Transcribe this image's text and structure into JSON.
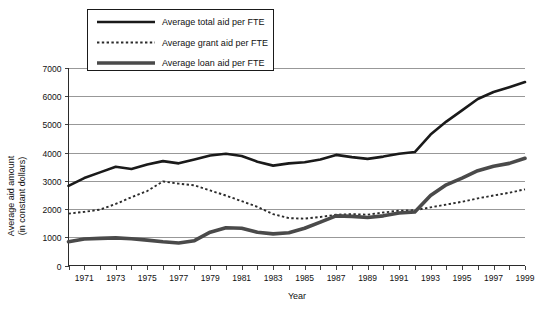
{
  "chart_data": {
    "type": "line",
    "title": "",
    "xlabel": "Year",
    "ylabel": "Average aid amount (in constant dollars)",
    "ylabel_line1": "Average aid amount",
    "ylabel_line2": "(in constant  dollars)",
    "xlim": [
      1970,
      1999
    ],
    "ylim": [
      0,
      7000
    ],
    "ytick_values": [
      0,
      1000,
      2000,
      3000,
      4000,
      5000,
      6000,
      7000
    ],
    "ytick_labels": [
      "0",
      "1000",
      "2000",
      "3000",
      "4000",
      "5000",
      "6000",
      "7000"
    ],
    "xtick_labels": [
      "1971",
      "1973",
      "1975",
      "1977",
      "1979",
      "1981",
      "1983",
      "1985",
      "1987",
      "1989",
      "1991",
      "1993",
      "1995",
      "1997",
      "1999"
    ],
    "xtick_values": [
      1971,
      1973,
      1975,
      1977,
      1979,
      1981,
      1983,
      1985,
      1987,
      1989,
      1991,
      1993,
      1995,
      1997,
      1999
    ],
    "x": [
      1970,
      1971,
      1972,
      1973,
      1974,
      1975,
      1976,
      1977,
      1978,
      1979,
      1980,
      1981,
      1982,
      1983,
      1984,
      1985,
      1986,
      1987,
      1988,
      1989,
      1990,
      1991,
      1992,
      1993,
      1994,
      1995,
      1996,
      1997,
      1998,
      1999
    ],
    "grid": "horizontal",
    "legend_position": "top-left",
    "series": [
      {
        "name": "Average total aid per FTE",
        "style": "solid",
        "color": "#1a1a1a",
        "width": 2.6,
        "values": [
          2820,
          3100,
          3300,
          3500,
          3420,
          3580,
          3700,
          3620,
          3760,
          3900,
          3960,
          3880,
          3680,
          3540,
          3620,
          3660,
          3760,
          3920,
          3840,
          3780,
          3860,
          3960,
          4020,
          4640,
          5100,
          5500,
          5900,
          6150,
          6320,
          6500
        ]
      },
      {
        "name": "Average grant aid per FTE",
        "style": "dotted",
        "color": "#2b2b2b",
        "width": 1.9,
        "values": [
          1840,
          1900,
          1980,
          2180,
          2420,
          2640,
          2980,
          2900,
          2840,
          2660,
          2480,
          2280,
          2080,
          1820,
          1680,
          1660,
          1720,
          1800,
          1820,
          1800,
          1880,
          1940,
          1960,
          2060,
          2160,
          2260,
          2380,
          2480,
          2580,
          2700
        ]
      },
      {
        "name": "Average loan aid per FTE",
        "style": "solid",
        "color": "#4a4a4a",
        "width": 3.6,
        "values": [
          840,
          940,
          960,
          980,
          950,
          900,
          840,
          800,
          880,
          1180,
          1340,
          1320,
          1180,
          1120,
          1160,
          1320,
          1540,
          1760,
          1740,
          1700,
          1760,
          1860,
          1900,
          2480,
          2860,
          3100,
          3360,
          3520,
          3620,
          3800
        ]
      }
    ]
  },
  "legend": {
    "items": [
      {
        "label": "Average total aid per FTE",
        "style": "solid-thin",
        "color": "#1a1a1a"
      },
      {
        "label": "Average grant aid per FTE",
        "style": "dotted",
        "color": "#2b2b2b"
      },
      {
        "label": "Average loan aid per FTE",
        "style": "solid-thick",
        "color": "#4a4a4a"
      }
    ]
  }
}
